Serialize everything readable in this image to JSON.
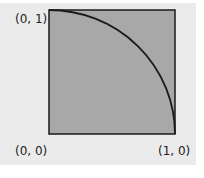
{
  "diagram": {
    "title": "",
    "shape": "unit square with quarter circle arc",
    "colors": {
      "background": "#ebebeb",
      "square_fill": "#a8a8a8",
      "stroke": "#1a1a1a"
    },
    "labels": {
      "top_left": "(0, 1)",
      "bottom_left": "(0, 0)",
      "bottom_right": "(1, 0)"
    }
  }
}
